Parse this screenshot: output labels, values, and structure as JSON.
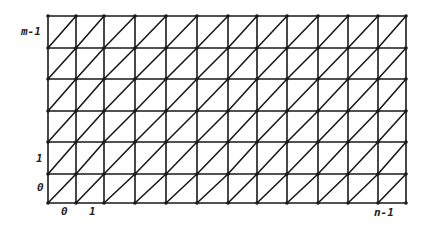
{
  "diagram": {
    "type": "triangulated-grid",
    "columns": 12,
    "rows": 6,
    "x_lines": [
      48,
      76,
      104,
      135,
      166,
      197,
      228,
      257,
      287,
      318,
      348,
      378,
      406
    ],
    "y_lines": [
      16,
      48,
      79,
      111,
      142,
      174,
      203
    ],
    "diagonal_direction": "bottom-left-to-top-right",
    "stroke_color": "#1a1a1a"
  },
  "labels": {
    "y_top": "m-1",
    "y_one": "1",
    "y_zero": "0",
    "x_zero": "0",
    "x_one": "1",
    "x_last": "n-1"
  }
}
